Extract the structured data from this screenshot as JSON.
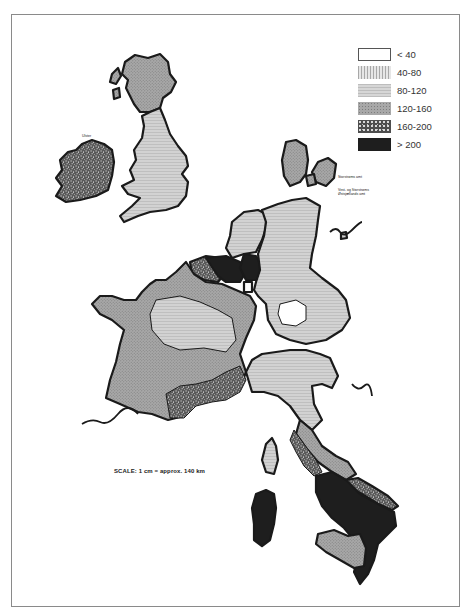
{
  "map": {
    "title": "",
    "scale_label": "SCALE: 1 cm = approx. 140 km",
    "annotations": {
      "denmark_islands_1": "Storstrøms amt",
      "denmark_islands_2a": "Vest- og Storstrøms",
      "denmark_islands_2b": "Østsjællands amt",
      "ireland_north": "Ulster"
    },
    "colors": {
      "frame": "#8a8a8a",
      "border": "#1a1a1a",
      "class_lt40": "#ffffff",
      "class_40_80": "#d6d6d6",
      "class_80_120": "#cfcfcf",
      "class_120_160": "#a6a6a6",
      "class_160_200": "#6e6e6e",
      "class_gt200": "#1e1e1e"
    }
  },
  "legend": {
    "items": [
      {
        "label": "< 40",
        "class": "lt40"
      },
      {
        "label": "40-80",
        "class": "40_80"
      },
      {
        "label": "80-120",
        "class": "80_120"
      },
      {
        "label": "120-160",
        "class": "120_160"
      },
      {
        "label": "160-200",
        "class": "160_200"
      },
      {
        "label": "> 200",
        "class": "gt200"
      }
    ]
  },
  "regions": [
    {
      "name": "Scotland",
      "class": "120-160"
    },
    {
      "name": "England & Wales",
      "class": "80-120"
    },
    {
      "name": "Ireland",
      "class": "160-200"
    },
    {
      "name": "Denmark",
      "class": "120-160"
    },
    {
      "name": "Netherlands",
      "class": "80-120"
    },
    {
      "name": "Belgium (north)",
      "class": "> 200"
    },
    {
      "name": "Belgium (west)",
      "class": "160-200"
    },
    {
      "name": "West Germany",
      "class": "80-120"
    },
    {
      "name": "Munich region",
      "class": "< 40"
    },
    {
      "name": "France (north & west)",
      "class": "120-160"
    },
    {
      "name": "France (centre)",
      "class": "80-120"
    },
    {
      "name": "France (south)",
      "class": "160-200"
    },
    {
      "name": "Northern Italy",
      "class": "80-120"
    },
    {
      "name": "Central Italy",
      "class": "120-160"
    },
    {
      "name": "Southern Italy",
      "class": "> 200"
    },
    {
      "name": "Sardinia",
      "class": "> 200"
    },
    {
      "name": "Corsica",
      "class": "80-120"
    },
    {
      "name": "Sicily",
      "class": "120-160"
    }
  ]
}
